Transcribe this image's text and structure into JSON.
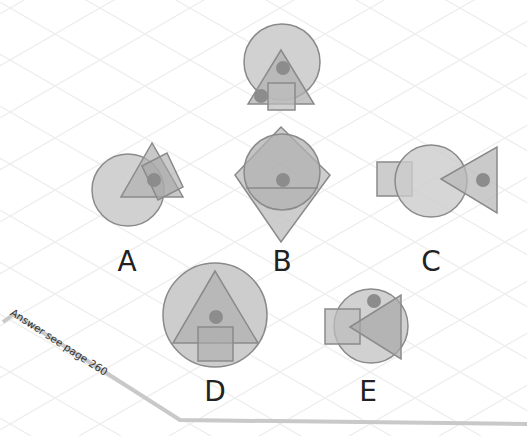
{
  "colors": {
    "fill_light": "#cfcfcf",
    "fill_mid": "#b5b5b5",
    "stroke": "#8a8a8a",
    "dot": "#8c8c8c",
    "grid": "#ececec",
    "answer_line": "#c8c8c8",
    "text": "#222222"
  },
  "puzzle": {
    "question_figure": {
      "name": "question-figure"
    },
    "options": [
      {
        "id": "A",
        "label": "A"
      },
      {
        "id": "B",
        "label": "B"
      },
      {
        "id": "C",
        "label": "C"
      },
      {
        "id": "D",
        "label": "D"
      },
      {
        "id": "E",
        "label": "E"
      }
    ]
  },
  "answer_note": "Answer see page 260"
}
